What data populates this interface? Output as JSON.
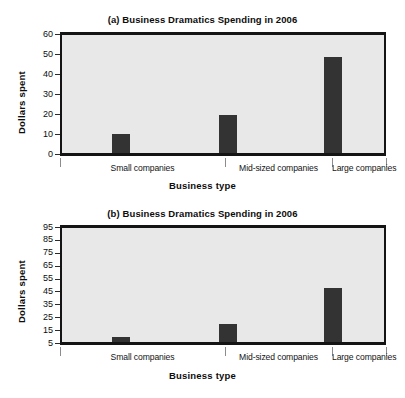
{
  "figures": [
    {
      "id": "a",
      "title": "(a) Business Dramatics Spending in 2006",
      "ylabel": "Dollars spent",
      "xlabel": "Business type"
    },
    {
      "id": "b",
      "title": "(b) Business Dramatics Spending in 2006",
      "ylabel": "Dollars spent",
      "xlabel": "Business type"
    }
  ],
  "chart_data": [
    {
      "type": "bar",
      "title": "(a) Business Dramatics Spending in 2006",
      "xlabel": "Business type",
      "ylabel": "Dollars spent",
      "categories": [
        "Small companies",
        "Mid-sized companies",
        "Large companies"
      ],
      "values": [
        9.5,
        19,
        48
      ],
      "ylim": [
        0,
        60
      ],
      "yticks": [
        0,
        10,
        20,
        30,
        40,
        50,
        60
      ],
      "ytick_labels": [
        "0",
        "10",
        "20",
        "30",
        "40",
        "50",
        "60"
      ],
      "grid": false,
      "legend": "none",
      "bar_color": "#333333",
      "plot_background": "#e8e8e8"
    },
    {
      "type": "bar",
      "title": "(b) Business Dramatics Spending in 2006",
      "xlabel": "Business type",
      "ylabel": "Dollars spent",
      "categories": [
        "Small companies",
        "Mid-sized companies",
        "Large companies"
      ],
      "values": [
        9,
        19,
        47
      ],
      "ylim": [
        5,
        95
      ],
      "yticks": [
        5,
        15,
        25,
        35,
        45,
        55,
        65,
        75,
        85,
        95
      ],
      "ytick_labels": [
        "5",
        "15",
        "25",
        "35",
        "45",
        "55",
        "65",
        "75",
        "85",
        "95"
      ],
      "grid": false,
      "legend": "none",
      "bar_color": "#333333",
      "plot_background": "#e8e8e8"
    }
  ]
}
